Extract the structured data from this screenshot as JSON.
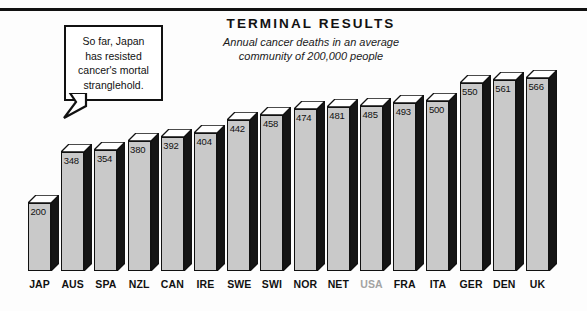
{
  "header": {
    "title": "TERMINAL RESULTS",
    "subtitle_line1": "Annual cancer deaths in an average",
    "subtitle_line2": "community of 200,000 people"
  },
  "callout": {
    "line1": "So far, Japan",
    "line2": "has resisted",
    "line3": "cancer's mortal",
    "line4": "stranglehold."
  },
  "style": {
    "bar_front_color": "#c9c9c9",
    "bar_top_color": "#ffffff",
    "bar_side_color": "#151515",
    "outline_color": "#111111",
    "highlight_label_color": "#a3a3a3",
    "background_color": "#fdfdfd"
  },
  "chart_data": {
    "type": "bar",
    "title": "TERMINAL RESULTS",
    "subtitle": "Annual cancer deaths in an average community of 200,000 people",
    "xlabel": "",
    "ylabel": "Annual cancer deaths per 200,000 people",
    "ylim": [
      0,
      600
    ],
    "grid": false,
    "legend": null,
    "highlighted_category": "USA",
    "categories": [
      "JAP",
      "AUS",
      "SPA",
      "NZL",
      "CAN",
      "IRE",
      "SWE",
      "SWI",
      "NOR",
      "NET",
      "USA",
      "FRA",
      "ITA",
      "GER",
      "DEN",
      "UK"
    ],
    "values": [
      200,
      348,
      354,
      380,
      392,
      404,
      442,
      458,
      474,
      481,
      485,
      493,
      500,
      550,
      561,
      566
    ],
    "data_labels": [
      "200",
      "348",
      "354",
      "380",
      "392",
      "404",
      "442",
      "458",
      "474",
      "481",
      "485",
      "493",
      "500",
      "550",
      "561",
      "566"
    ]
  }
}
